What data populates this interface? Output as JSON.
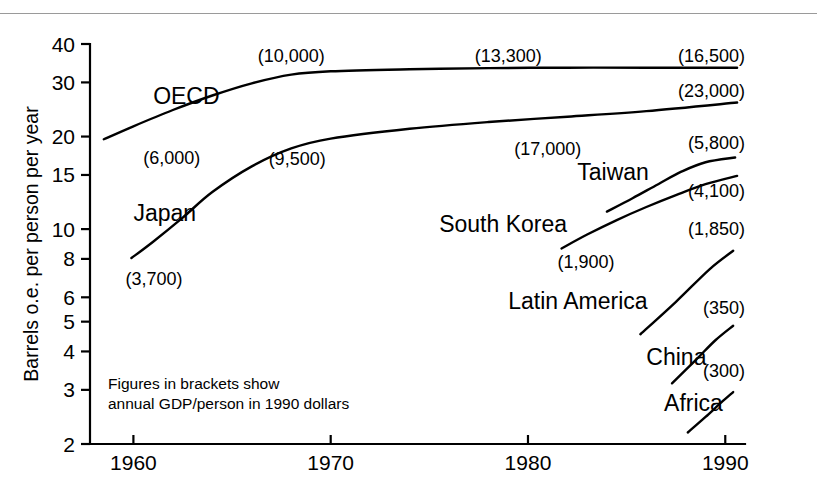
{
  "chart_data": {
    "type": "line",
    "title": "",
    "xlabel": "",
    "ylabel": "Barrels o.e. per person per year",
    "yscale": "log",
    "ylim": [
      2,
      40
    ],
    "xlim": [
      1957.8,
      1991
    ],
    "grid": false,
    "legend_position": "inline-labels",
    "ytick_labels": [
      "40",
      "30",
      "20",
      "15",
      "10",
      "8",
      "6",
      "5",
      "4",
      "3",
      "2"
    ],
    "ytick_values": [
      40,
      30,
      20,
      15,
      10,
      8,
      6,
      5,
      4,
      3,
      2
    ],
    "xtick_labels": [
      "1960",
      "1970",
      "1980",
      "1990"
    ],
    "xtick_values": [
      1960,
      1970,
      1980,
      1990
    ],
    "annotation": "Figures in brackets show annual GDP/person in 1990 dollars",
    "annotation_lines": [
      "Figures in brackets show",
      "annual GDP/person in 1990 dollars"
    ],
    "series": [
      {
        "name": "OECD",
        "label_x": 1961.0,
        "label_y": 27.0,
        "x": [
          1958.5,
          1960,
          1962,
          1964,
          1966,
          1968,
          1970,
          1974,
          1978,
          1982,
          1986,
          1990.6
        ],
        "y": [
          19.6,
          21.6,
          24.4,
          27.2,
          29.8,
          31.8,
          32.6,
          33.1,
          33.4,
          33.5,
          33.5,
          33.5
        ],
        "annotations": [
          {
            "text": "(6,000)",
            "x": 1960.5,
            "y": 17.0,
            "anchor": "start"
          },
          {
            "text": "(10,000)",
            "x": 1968.0,
            "y": 36.5,
            "anchor": "middle"
          },
          {
            "text": "(13,300)",
            "x": 1979.0,
            "y": 36.5,
            "anchor": "middle"
          },
          {
            "text": "(16,500)",
            "x": 1991.0,
            "y": 36.5,
            "anchor": "end"
          }
        ]
      },
      {
        "name": "Japan",
        "label_x": 1960.0,
        "label_y": 11.3,
        "x": [
          1959.9,
          1961,
          1962.5,
          1964,
          1966,
          1968,
          1970,
          1974,
          1978,
          1982,
          1986,
          1990.6
        ],
        "y": [
          8.05,
          9.1,
          10.9,
          13.2,
          16.0,
          18.3,
          19.7,
          21.2,
          22.3,
          23.2,
          24.2,
          25.8
        ],
        "annotations": [
          {
            "text": "(3,700)",
            "x": 1959.6,
            "y": 6.9,
            "anchor": "start"
          },
          {
            "text": "(9,500)",
            "x": 1968.3,
            "y": 16.9,
            "anchor": "middle"
          },
          {
            "text": "(17,000)",
            "x": 1981.0,
            "y": 18.2,
            "anchor": "middle"
          },
          {
            "text": "(23,000)",
            "x": 1991.0,
            "y": 28.2,
            "anchor": "end"
          }
        ]
      },
      {
        "name": "Taiwan",
        "label_x": 1982.5,
        "label_y": 15.3,
        "x": [
          1984.0,
          1985.3,
          1986.6,
          1987.8,
          1989.0,
          1990.5
        ],
        "y": [
          11.4,
          12.6,
          14.0,
          15.4,
          16.5,
          17.1
        ],
        "annotations": [
          {
            "text": "(5,800)",
            "x": 1991.0,
            "y": 19.0,
            "anchor": "end"
          }
        ]
      },
      {
        "name": "South Korea",
        "label_x": 1975.5,
        "label_y": 10.4,
        "x": [
          1981.7,
          1983,
          1984.5,
          1986,
          1987.5,
          1989,
          1990.6
        ],
        "y": [
          8.65,
          9.6,
          10.7,
          11.8,
          12.9,
          14.0,
          14.9
        ],
        "annotations": [
          {
            "text": "(1,900)",
            "x": 1981.5,
            "y": 7.8,
            "anchor": "start"
          },
          {
            "text": "(4,100)",
            "x": 1991.0,
            "y": 13.3,
            "anchor": "end"
          }
        ]
      },
      {
        "name": "Latin America",
        "label_x": 1979.0,
        "label_y": 5.85,
        "x": [
          1985.7,
          1987.5,
          1989.2,
          1990.4
        ],
        "y": [
          4.55,
          5.8,
          7.4,
          8.5
        ],
        "annotations": [
          {
            "text": "(1,850)",
            "x": 1991.0,
            "y": 10.0,
            "anchor": "end"
          }
        ]
      },
      {
        "name": "China",
        "label_x": 1986.0,
        "label_y": 3.85,
        "x": [
          1987.3,
          1988.5,
          1989.5,
          1990.4
        ],
        "y": [
          3.15,
          3.75,
          4.35,
          4.85
        ],
        "annotations": [
          {
            "text": "(350)",
            "x": 1991.0,
            "y": 5.55,
            "anchor": "end"
          }
        ]
      },
      {
        "name": "Africa",
        "label_x": 1986.9,
        "label_y": 2.72,
        "x": [
          1988.1,
          1989.0,
          1989.8,
          1990.4
        ],
        "y": [
          2.18,
          2.45,
          2.73,
          2.95
        ],
        "annotations": [
          {
            "text": "(300)",
            "x": 1991.0,
            "y": 3.45,
            "anchor": "end"
          }
        ]
      }
    ]
  }
}
